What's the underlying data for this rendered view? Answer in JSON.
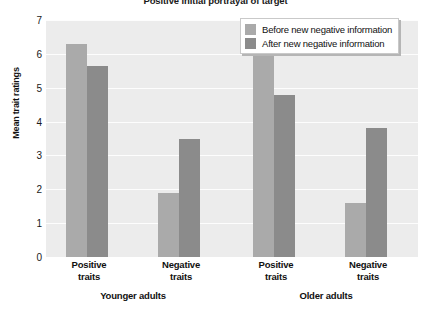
{
  "chart_data": {
    "type": "bar",
    "title": "Positive initial portrayal of target",
    "xlabel": "",
    "ylabel": "Mean trait ratings",
    "ylim": [
      0,
      7
    ],
    "yticks": [
      0,
      1,
      2,
      3,
      4,
      5,
      6,
      7
    ],
    "grid": true,
    "legend_position": "top-right",
    "groups": [
      {
        "name": "Younger adults"
      },
      {
        "name": "Older adults"
      }
    ],
    "categories": [
      "Positive traits",
      "Negative traits",
      "Positive traits",
      "Negative traits"
    ],
    "category_lines": [
      [
        "Positive",
        "traits"
      ],
      [
        "Negative",
        "traits"
      ],
      [
        "Positive",
        "traits"
      ],
      [
        "Negative",
        "traits"
      ]
    ],
    "series": [
      {
        "name": "Before new negative information",
        "color": "#aaaaaa",
        "values": [
          6.3,
          1.9,
          6.25,
          1.6
        ]
      },
      {
        "name": "After new negative information",
        "color": "#8b8b8b",
        "values": [
          5.65,
          3.5,
          4.8,
          3.8
        ]
      }
    ]
  },
  "axis": {
    "y_title": "Mean trait ratings",
    "y_tick_labels": [
      "7",
      "6",
      "5",
      "4",
      "3",
      "2",
      "1",
      "0"
    ]
  },
  "legend": {
    "items": [
      {
        "label": "Before new negative information"
      },
      {
        "label": "After new negative information"
      }
    ]
  },
  "groups": {
    "younger": "Younger adults",
    "older": "Older adults"
  },
  "ticks": {
    "t0_l1": "Positive",
    "t0_l2": "traits",
    "t1_l1": "Negative",
    "t1_l2": "traits",
    "t2_l1": "Positive",
    "t2_l2": "traits",
    "t3_l1": "Negative",
    "t3_l2": "traits"
  },
  "colors": {
    "before": "#aaaaaa",
    "after": "#8b8b8b",
    "plot_background": "#ececec",
    "gridline": "#fdfdfd"
  }
}
